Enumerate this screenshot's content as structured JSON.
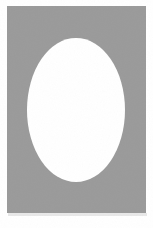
{
  "figure": {
    "title": "Gray rectangular panel with centered white ellipse",
    "canvas": {
      "width": 153,
      "height": 228,
      "background_color": "#ffffff"
    },
    "panel": {
      "label": "gray background panel",
      "fill_color": "#9a9a9a",
      "x": 7,
      "y": 6,
      "width": 139,
      "height": 207
    },
    "shadow": {
      "label": "soft bottom shadow",
      "fill_color": "#e8e8e8",
      "x": 8,
      "y": 213,
      "width": 139,
      "height": 3
    },
    "ellipse": {
      "label": "white ellipse",
      "fill_color": "#ffffff",
      "center_x": 76,
      "center_y": 110,
      "radius_x": 49,
      "radius_y": 72
    }
  },
  "chart_data": {
    "type": "scatter",
    "title": "Gray rectangular panel with centered white ellipse",
    "subtitle": "",
    "xlabel": "",
    "ylabel": "",
    "xlim": [
      0,
      153
    ],
    "ylim": [
      0,
      228
    ],
    "grid": false,
    "legend": "none",
    "tick_labels_x": [],
    "tick_labels_y": [],
    "annotations": [],
    "shapes": [
      {
        "name": "gray-panel",
        "kind": "rectangle",
        "x": 7,
        "y": 6,
        "width": 139,
        "height": 207,
        "color": "#9a9a9a"
      },
      {
        "name": "white-ellipse",
        "kind": "ellipse",
        "cx": 76,
        "cy": 110,
        "rx": 49,
        "ry": 72,
        "color": "#ffffff"
      },
      {
        "name": "bottom-shadow",
        "kind": "rectangle",
        "x": 8,
        "y": 213,
        "width": 139,
        "height": 3,
        "color": "#e8e8e8"
      }
    ],
    "series": [],
    "categories": [],
    "values": []
  }
}
